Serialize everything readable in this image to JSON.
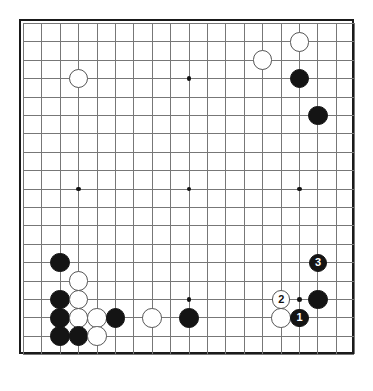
{
  "diagram": {
    "kind": "go-board-diagram",
    "board_size": 19,
    "geometry": {
      "origin_x": 21,
      "origin_y": 21,
      "spacing": 18.4,
      "stone_diameter": 19.6,
      "numbered_stone_diameter": 18.2,
      "star_dot_diameter": 4.6
    },
    "colors": {
      "background": "#ffffff",
      "grid": "#777777",
      "border": "#1a1a1a",
      "black_stone": "#141414",
      "white_stone": "#ffffff",
      "white_stone_outline": "#555555",
      "black_label_text": "#ffffff",
      "white_label_text": "#111111"
    },
    "star_points": [
      {
        "col": 3,
        "row": 3
      },
      {
        "col": 9,
        "row": 3
      },
      {
        "col": 15,
        "row": 3
      },
      {
        "col": 3,
        "row": 9
      },
      {
        "col": 9,
        "row": 9
      },
      {
        "col": 15,
        "row": 9
      },
      {
        "col": 3,
        "row": 15
      },
      {
        "col": 9,
        "row": 15
      },
      {
        "col": 15,
        "row": 15
      }
    ],
    "stones": [
      {
        "id": "w-q18",
        "color": "white",
        "col": 15,
        "row": 1,
        "label": ""
      },
      {
        "id": "w-o17",
        "color": "white",
        "col": 13,
        "row": 2,
        "label": ""
      },
      {
        "id": "b-q16",
        "color": "black",
        "col": 15,
        "row": 3,
        "label": ""
      },
      {
        "id": "b-r14",
        "color": "black",
        "col": 16,
        "row": 5,
        "label": ""
      },
      {
        "id": "w-d16",
        "color": "white",
        "col": 3,
        "row": 3,
        "label": ""
      },
      {
        "id": "b-c6",
        "color": "black",
        "col": 2,
        "row": 13,
        "label": ""
      },
      {
        "id": "w-d5",
        "color": "white",
        "col": 3,
        "row": 14,
        "label": ""
      },
      {
        "id": "b-c4",
        "color": "black",
        "col": 2,
        "row": 15,
        "label": ""
      },
      {
        "id": "w-d4",
        "color": "white",
        "col": 3,
        "row": 15,
        "label": ""
      },
      {
        "id": "b-c3",
        "color": "black",
        "col": 2,
        "row": 16,
        "label": ""
      },
      {
        "id": "w-d3",
        "color": "white",
        "col": 3,
        "row": 16,
        "label": ""
      },
      {
        "id": "w-e3",
        "color": "white",
        "col": 4,
        "row": 16,
        "label": ""
      },
      {
        "id": "b-f3",
        "color": "black",
        "col": 5,
        "row": 16,
        "label": ""
      },
      {
        "id": "b-c2",
        "color": "black",
        "col": 2,
        "row": 17,
        "label": ""
      },
      {
        "id": "b-d2",
        "color": "black",
        "col": 3,
        "row": 17,
        "label": ""
      },
      {
        "id": "w-e2",
        "color": "white",
        "col": 4,
        "row": 17,
        "label": ""
      },
      {
        "id": "w-h3",
        "color": "white",
        "col": 7,
        "row": 16,
        "label": ""
      },
      {
        "id": "b-k3",
        "color": "black",
        "col": 9,
        "row": 16,
        "label": ""
      },
      {
        "id": "b-r4",
        "color": "black",
        "col": 16,
        "row": 15,
        "label": ""
      },
      {
        "id": "mv-3",
        "color": "black",
        "col": 16,
        "row": 13,
        "label": "3"
      },
      {
        "id": "mv-2",
        "color": "white",
        "col": 14,
        "row": 15,
        "label": "2"
      },
      {
        "id": "mv-1",
        "color": "black",
        "col": 15,
        "row": 16,
        "label": "1"
      },
      {
        "id": "w-o3",
        "color": "white",
        "col": 14,
        "row": 16,
        "label": ""
      }
    ],
    "move_sequence": [
      {
        "number": "1",
        "color": "black"
      },
      {
        "number": "2",
        "color": "white"
      },
      {
        "number": "3",
        "color": "black"
      }
    ]
  }
}
